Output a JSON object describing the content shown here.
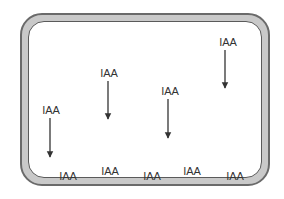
{
  "diagram": {
    "title": "",
    "colors": {
      "wall_fill": "#c9c9c9",
      "wall_stroke": "#6a6a6a",
      "interior": "#ffffff",
      "text": "#333333",
      "arrow": "#333333"
    },
    "moving_labels": [
      {
        "text": "IAA",
        "x": 228,
        "y": 37
      },
      {
        "text": "IAA",
        "x": 109,
        "y": 68
      },
      {
        "text": "IAA",
        "x": 170,
        "y": 86
      },
      {
        "text": "IAA",
        "x": 51,
        "y": 105
      }
    ],
    "arrows": [
      {
        "x": 225,
        "y1": 50,
        "y2": 88
      },
      {
        "x": 108,
        "y1": 81,
        "y2": 119
      },
      {
        "x": 168,
        "y1": 99,
        "y2": 138
      },
      {
        "x": 50,
        "y1": 118,
        "y2": 157
      }
    ],
    "bottom_labels": [
      {
        "text": "IAA",
        "x": 68,
        "y": 171
      },
      {
        "text": "IAA",
        "x": 110,
        "y": 166
      },
      {
        "text": "IAA",
        "x": 152,
        "y": 171
      },
      {
        "text": "IAA",
        "x": 192,
        "y": 166
      },
      {
        "text": "IAA",
        "x": 235,
        "y": 171
      }
    ]
  }
}
